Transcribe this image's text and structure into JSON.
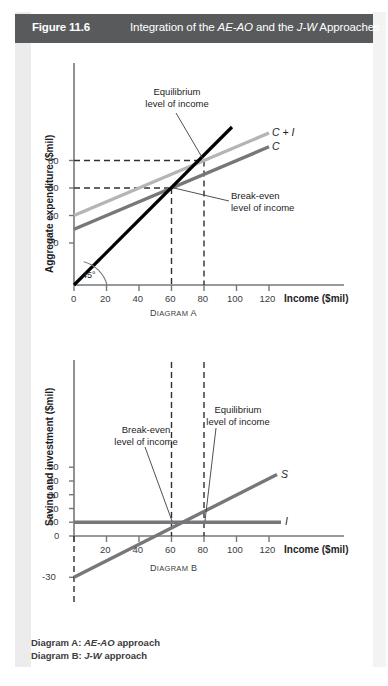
{
  "header": {
    "figure_number": "Figure 11.6",
    "title_prefix": "Integration of the ",
    "title_em1": "AE-AO",
    "title_mid": " and the ",
    "title_em2": "J-W",
    "title_suffix": " Approaches",
    "bar_color": "#595a5c"
  },
  "footer": {
    "line1_label": "Diagram A: ",
    "line1_em": "AE-AO",
    "line1_rest": " approach",
    "line2_label": "Diagram B: ",
    "line2_em": "J-W",
    "line2_rest": " approach"
  },
  "chart_data": [
    {
      "id": "diagram-a",
      "type": "line",
      "title": "Diagram A",
      "xlabel": "Income ($mil)",
      "ylabel": "Aggregate expenditure ($mil)",
      "xlim": [
        0,
        130
      ],
      "ylim": [
        0,
        105
      ],
      "xticks": [
        0,
        20,
        40,
        60,
        80,
        100,
        120
      ],
      "yticks": [
        20,
        40,
        60,
        80
      ],
      "grid": false,
      "legend_position": "right-inline",
      "series": [
        {
          "name": "45° line (AE = AO)",
          "label": "",
          "color": "#000000",
          "points": [
            [
              0,
              0
            ],
            [
              100,
              100
            ]
          ]
        },
        {
          "name": "C + I",
          "label": "C + I",
          "color": "#b4b5b6",
          "points": [
            [
              0,
              40
            ],
            [
              120,
              100
            ]
          ]
        },
        {
          "name": "C",
          "label": "C",
          "color": "#76777a",
          "points": [
            [
              0,
              30
            ],
            [
              120,
              90
            ]
          ]
        }
      ],
      "reference_lines": [
        {
          "name": "equilibrium-horizontal",
          "orientation": "h",
          "value": 80,
          "style": "dashed",
          "from_x": 0,
          "to_x": 80
        },
        {
          "name": "break-even-horizontal",
          "orientation": "h",
          "value": 60,
          "style": "dashed",
          "from_x": 0,
          "to_x": 60
        },
        {
          "name": "equilibrium-vertical",
          "orientation": "v",
          "value": 80,
          "style": "dashed",
          "from_y": 0,
          "to_y": 80
        },
        {
          "name": "break-even-vertical",
          "orientation": "v",
          "value": 60,
          "style": "dashed",
          "from_y": 0,
          "to_y": 60
        }
      ],
      "annotations": [
        {
          "name": "equilibrium-level-of-income",
          "line1": "Equilibrium",
          "line2": "level of income",
          "target": [
            80,
            80
          ]
        },
        {
          "name": "break-even-level-of-income",
          "line1": "Break-even",
          "line2": "level of income",
          "target": [
            60,
            60
          ]
        },
        {
          "name": "forty-five-degree-angle",
          "text": "45°"
        }
      ]
    },
    {
      "id": "diagram-b",
      "type": "line",
      "title": "Diagram B",
      "xlabel": "Income ($mil)",
      "ylabel": "Saving and investment ($mil)",
      "xlim": [
        0,
        130
      ],
      "ylim": [
        -35,
        95
      ],
      "xticks": [
        0,
        20,
        40,
        60,
        80,
        100,
        120
      ],
      "yticks": [
        -30,
        0,
        10,
        20,
        30,
        40,
        50
      ],
      "grid": false,
      "legend_position": "right-inline",
      "series": [
        {
          "name": "S",
          "label": "S",
          "color": "#76777a",
          "points": [
            [
              0,
              -30
            ],
            [
              120,
              45
            ]
          ]
        },
        {
          "name": "I",
          "label": "I",
          "color": "#76777a",
          "points": [
            [
              0,
              10
            ],
            [
              120,
              10
            ]
          ]
        }
      ],
      "reference_lines": [
        {
          "name": "break-even-vertical",
          "orientation": "v",
          "value": 60,
          "style": "dashed",
          "from_y": -35,
          "to_y": 92
        },
        {
          "name": "equilibrium-vertical",
          "orientation": "v",
          "value": 80,
          "style": "dashed",
          "from_y": -35,
          "to_y": 92
        },
        {
          "name": "origin-vertical",
          "orientation": "v",
          "value": 0,
          "style": "dashed",
          "from_y": -42,
          "to_y": 0
        }
      ],
      "annotations": [
        {
          "name": "break-even-level-of-income",
          "line1": "Break-even",
          "line2": "level of income",
          "target": [
            60,
            10
          ]
        },
        {
          "name": "equilibrium-level-of-income",
          "line1": "Equilibrium",
          "line2": "level of income",
          "target": [
            80,
            10
          ]
        }
      ]
    }
  ],
  "colors": {
    "axis": "#76777a",
    "text": "#1d1d1f",
    "header_bar": "#595a5c",
    "line_black": "#000000",
    "line_light_gray": "#b4b5b6",
    "line_mid_gray": "#76777a",
    "panel_margin": "#ececed"
  }
}
